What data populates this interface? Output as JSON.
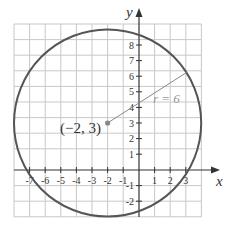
{
  "diagram": {
    "type": "circle-on-coordinate-plane",
    "axes": {
      "x_label": "x",
      "y_label": "y",
      "x_ticks": [
        "-7",
        "-6",
        "-5",
        "-4",
        "-3",
        "-2",
        "-1",
        "1",
        "2",
        "3"
      ],
      "y_ticks": [
        "8",
        "7",
        "6",
        "5",
        "4",
        "3",
        "2",
        "1",
        "-1",
        "-2"
      ],
      "x_range": [
        -8,
        4
      ],
      "y_range": [
        -3,
        9
      ]
    },
    "circle": {
      "center": [
        -2,
        3
      ],
      "radius": 6,
      "center_label": "(−2, 3)",
      "radius_label": "r = 6",
      "stroke_color": "#555555"
    },
    "colors": {
      "grid": "#c8c8c8",
      "axis": "#333333",
      "radius_line": "#888888",
      "center_point": "#888888"
    }
  }
}
